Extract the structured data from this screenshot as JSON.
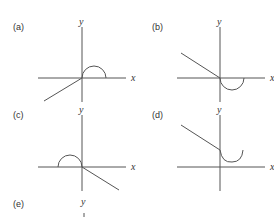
{
  "panels": [
    {
      "label": "(a)",
      "y_axis": "y",
      "x_axis": "x",
      "description": "line from lower-left to origin, semicircle above positive x-axis"
    },
    {
      "label": "(b)",
      "y_axis": "y",
      "x_axis": "x",
      "description": "line from upper-left to origin, semicircle below positive x-axis"
    },
    {
      "label": "(c)",
      "y_axis": "y",
      "x_axis": "x",
      "description": "semicircle above negative x-axis, line from origin to lower-right"
    },
    {
      "label": "(d)",
      "y_axis": "y",
      "x_axis": "x",
      "description": "line from upper-left to positive y-axis, U-shaped arc above positive x-axis"
    },
    {
      "label": "(e)",
      "y_axis": "y",
      "x_axis": "",
      "description": "partially visible"
    }
  ],
  "colors": {
    "stroke": "#555555",
    "text": "#333333"
  }
}
